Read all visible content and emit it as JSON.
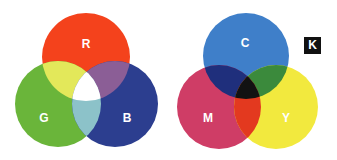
{
  "additive": {
    "name": "RGB additive color model",
    "labels": {
      "r": "R",
      "g": "G",
      "b": "B"
    },
    "colors": {
      "red": "#f4421c",
      "green": "#6ab53a",
      "blue": "#2c3e8f",
      "red_green": "#e3e85a",
      "red_blue": "#8b5e96",
      "green_blue": "#8cc2c9",
      "center": "#ffffff"
    }
  },
  "subtractive": {
    "name": "CMYK subtractive color model",
    "labels": {
      "c": "C",
      "m": "M",
      "y": "Y",
      "k": "K"
    },
    "colors": {
      "cyan": "#3f7fc9",
      "magenta": "#cf3d66",
      "yellow": "#f2e93e",
      "cyan_magenta": "#1f2f7c",
      "cyan_yellow": "#3b8a3c",
      "magenta_yellow": "#e3391f",
      "center": "#121212",
      "key": "#111111"
    }
  }
}
